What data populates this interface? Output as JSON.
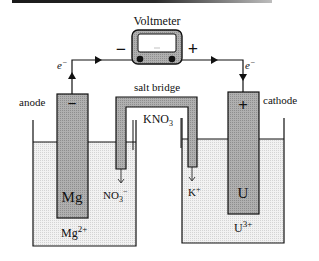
{
  "diagram": {
    "type": "galvanic-cell",
    "voltmeter": {
      "label": "Voltmeter",
      "negative_terminal": "−",
      "positive_terminal": "+"
    },
    "wire": {
      "electron_label_left": "e",
      "electron_label_right": "e",
      "electron_charge": "−"
    },
    "anode": {
      "label": "anode",
      "sign": "−",
      "metal": "Mg",
      "ion": "Mg",
      "ion_charge": "2+"
    },
    "cathode": {
      "label": "cathode",
      "sign": "+",
      "metal": "U",
      "ion": "U",
      "ion_charge": "3+"
    },
    "salt_bridge": {
      "label": "salt bridge",
      "electrolyte": "KNO",
      "electrolyte_subscript": "3",
      "anion_left": "NO",
      "anion_left_subscript": "3",
      "anion_left_charge": "−",
      "cation_right": "K",
      "cation_right_charge": "+"
    },
    "colors": {
      "electrode_fill": "#a9a9a9",
      "solution_fill": "#ececec",
      "line": "#111111",
      "meter_fill": "#b8b8b8"
    }
  }
}
